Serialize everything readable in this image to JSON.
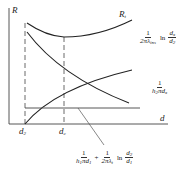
{
  "diagram": {
    "axes": {
      "y_label": "R",
      "x_label": "d"
    },
    "x_markers": [
      {
        "label": "d",
        "sub": "2"
      },
      {
        "label": "d",
        "sub": "c"
      }
    ],
    "curves": {
      "total": {
        "label": "R",
        "sub": "t"
      },
      "insulation": {
        "num": "1",
        "den_pre": "2πλ",
        "den_sub": "ins",
        "ln": "ln",
        "frac_num": "d",
        "frac_num_sub": "x",
        "frac_den": "d",
        "frac_den_sub": "2"
      },
      "outer_convection": {
        "num": "1",
        "den_pre": "h",
        "den_sub1": "2",
        "den_mid": "πd",
        "den_sub2": "x"
      },
      "constant": {
        "term1": {
          "num": "1",
          "den_pre": "h",
          "den_sub1": "1",
          "den_mid": "πd",
          "den_sub2": "1"
        },
        "plus": "+",
        "term2": {
          "num": "1",
          "den_pre": "2πλ",
          "den_sub": "t"
        },
        "ln": "ln",
        "frac": {
          "num": "d",
          "num_sub": "2",
          "den": "d",
          "den_sub": "1"
        }
      }
    }
  }
}
